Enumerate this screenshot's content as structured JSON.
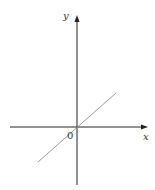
{
  "diagram": {
    "axes": {
      "x_label": "x",
      "y_label": "y",
      "origin_label": "0"
    },
    "line": {
      "description": "straight line through origin with positive slope",
      "color": "#999999"
    },
    "colors": {
      "axis": "#222222",
      "line": "#999999"
    }
  }
}
